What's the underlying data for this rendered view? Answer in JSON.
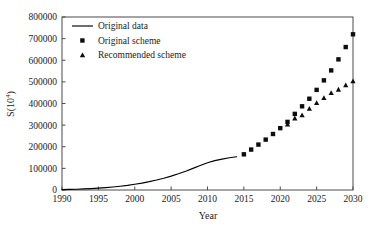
{
  "chart_data": {
    "type": "line",
    "title": "",
    "xlabel": "Year",
    "ylabel": "S(10⁴)",
    "xlim": [
      1990,
      2030
    ],
    "ylim": [
      0,
      800000
    ],
    "xticks": [
      1990,
      1995,
      2000,
      2005,
      2010,
      2015,
      2020,
      2025,
      2030
    ],
    "yticks": [
      0,
      100000,
      200000,
      300000,
      400000,
      500000,
      600000,
      700000,
      800000
    ],
    "xtick_labels": [
      "1990",
      "1995",
      "2000",
      "2005",
      "2010",
      "2015",
      "2020",
      "2025",
      "2030"
    ],
    "ytick_labels": [
      "0",
      "100000",
      "200000",
      "300000",
      "400000",
      "500000",
      "600000",
      "700000",
      "800000"
    ],
    "grid": false,
    "legend_position": "upper-left",
    "series": [
      {
        "name": "Original data",
        "style": "line",
        "marker": "none",
        "color": "#000000",
        "x": [
          1990,
          1991,
          1992,
          1993,
          1994,
          1995,
          1996,
          1997,
          1998,
          1999,
          2000,
          2001,
          2002,
          2003,
          2004,
          2005,
          2006,
          2007,
          2008,
          2009,
          2010,
          2011,
          2012,
          2013,
          2014
        ],
        "values": [
          1800,
          2600,
          3600,
          4900,
          6500,
          8500,
          11000,
          14000,
          17500,
          21500,
          26500,
          32000,
          38500,
          46000,
          54500,
          64000,
          75000,
          87000,
          100000,
          113000,
          126000,
          136000,
          143000,
          149000,
          154000
        ]
      },
      {
        "name": "Original scheme",
        "style": "markers",
        "marker": "square",
        "color": "#0d0d0d",
        "x": [
          2015,
          2016,
          2017,
          2018,
          2019,
          2020,
          2021,
          2022,
          2023,
          2024,
          2025,
          2026,
          2027,
          2028,
          2029,
          2030
        ],
        "values": [
          165000,
          187000,
          210000,
          233000,
          259000,
          286000,
          315000,
          352000,
          387000,
          422000,
          463000,
          507000,
          553000,
          604000,
          661000,
          720000
        ]
      },
      {
        "name": "Recommended scheme",
        "style": "markers",
        "marker": "triangle",
        "color": "#0d0d0d",
        "x": [
          2021,
          2022,
          2023,
          2024,
          2025,
          2026,
          2027,
          2028,
          2029,
          2030
        ],
        "values": [
          305000,
          333000,
          347000,
          377000,
          404000,
          427000,
          450000,
          466000,
          486000,
          505000
        ]
      }
    ]
  },
  "legend": {
    "items": [
      {
        "label": "Original data",
        "marker": "line"
      },
      {
        "label": "Original scheme",
        "marker": "square"
      },
      {
        "label": "Recommended scheme",
        "marker": "triangle"
      }
    ]
  }
}
